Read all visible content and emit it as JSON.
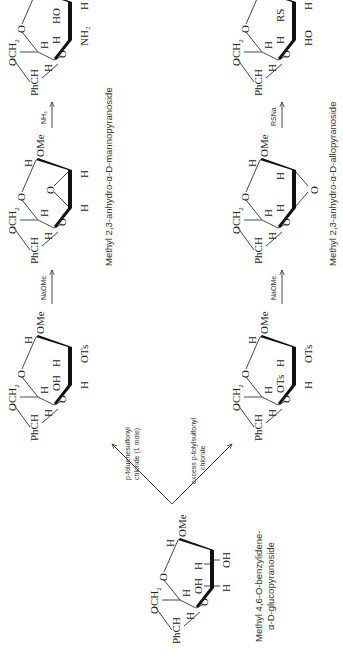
{
  "diagram": {
    "type": "reaction-scheme",
    "orientation": "rotated-90-ccw",
    "starting_material": {
      "name_line1": "Methyl 4,6-O-benzylidene-",
      "name_line2": "α-D-glucopyranoside",
      "substituents": {
        "c2": "OH",
        "c3": "OH",
        "c1": "OMe"
      }
    },
    "branches": [
      {
        "id": "one-mole",
        "reagent_line1": "p-toluenesulfonyl",
        "reagent_line2": "chloride (1 mole)",
        "tosylate": {
          "c2": "OTs",
          "c3": "OH",
          "c1": "OMe"
        },
        "step2_reagent": "NaOMe",
        "epoxide_name": "Methyl 2,3-anhydro-α-D-mannopyranoside",
        "step3_reagent": "NH₃",
        "product": {
          "c2": "HO",
          "c3": "NH₂",
          "c1": "OMe"
        }
      },
      {
        "id": "excess",
        "reagent_line1": "excess p-tolylsulfonyl",
        "reagent_line2": "chloride",
        "tosylate": {
          "c2": "OTs",
          "c3": "OTs",
          "c1": "OMe"
        },
        "step2_reagent": "NaOMe",
        "epoxide_name": "Methyl 2,3-anhydro-α-D-allopyranoside",
        "step3_reagent": "RSNa",
        "product": {
          "c2": "RS",
          "c3": "HO",
          "c1": "OMe"
        }
      }
    ],
    "common_labels": {
      "h": "H",
      "o": "O",
      "och2": "OCH",
      "och2_sub": "2",
      "phch": "PhCH",
      "ome": "OMe"
    }
  }
}
